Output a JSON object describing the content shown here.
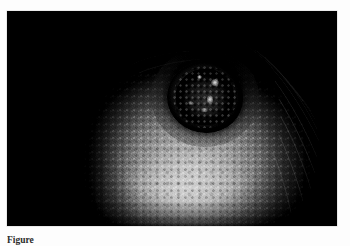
{
  "page": {
    "background_color": "#fdfdfd"
  },
  "figure": {
    "photo": {
      "alt_description": "Clinical photograph: dark ulcerated crater-like nodule on haired skin, grayscale, vignetted",
      "modality": "clinical-photograph",
      "color_mode": "grayscale",
      "frame_background": "#000000",
      "highlight_color": "#e4e2de",
      "midtone_color": "#8e8c88",
      "shadow_color": "#0a0a0a"
    },
    "lesion": {
      "name": "ulcerated-nodule",
      "rim_color": "#2c2b2a",
      "crater_color": "#101010",
      "specular_highlight_color": "#ffffff"
    },
    "caption": {
      "label": "Figure",
      "text": "Figure",
      "visible": "partially-clipped"
    }
  }
}
